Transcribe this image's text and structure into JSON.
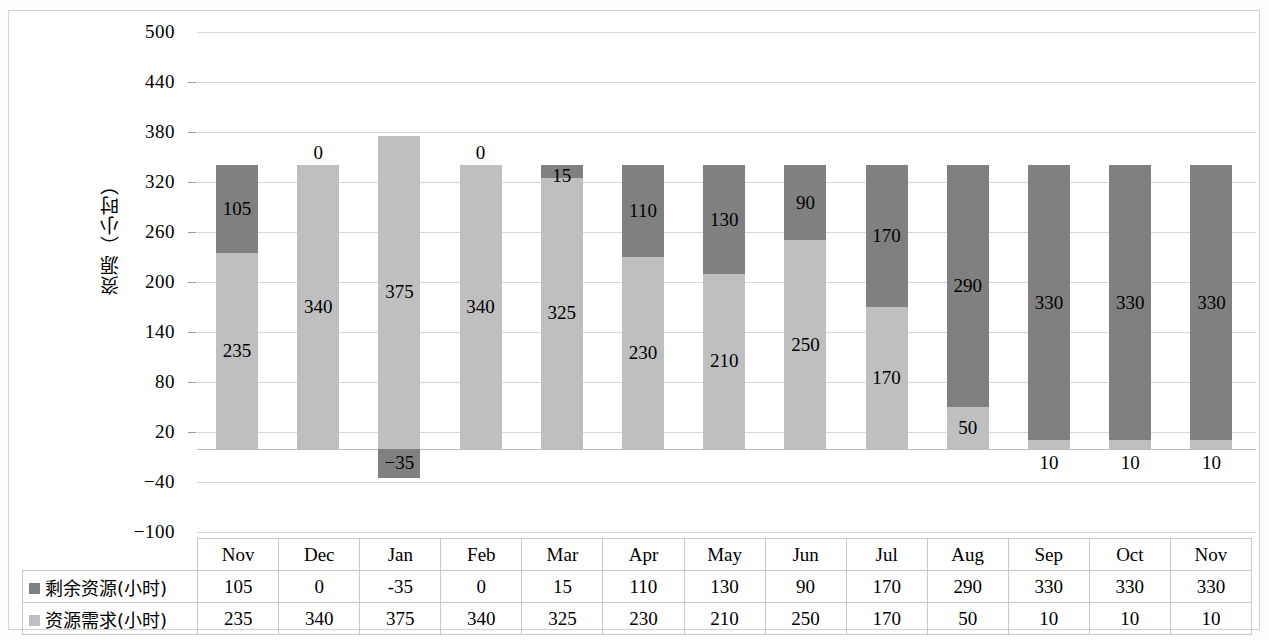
{
  "chart_data": {
    "type": "bar",
    "subtype": "stacked-column",
    "title": "",
    "xlabel": "",
    "ylabel": "资源（小时）",
    "ylim": [
      -100,
      500
    ],
    "yticks": [
      500,
      440,
      380,
      320,
      260,
      200,
      140,
      80,
      20,
      -40,
      -100
    ],
    "ytick_labels": [
      "500",
      "440",
      "380",
      "320",
      "260",
      "200",
      "140",
      "80",
      "20",
      "−40",
      "−100"
    ],
    "grid": true,
    "legend_position": "data-table-row-headers",
    "categories": [
      "Nov",
      "Dec",
      "Jan",
      "Feb",
      "Mar",
      "Apr",
      "May",
      "Jun",
      "Jul",
      "Aug",
      "Sep",
      "Oct",
      "Nov"
    ],
    "series": [
      {
        "name": "资源需求(小时)",
        "color": "#bfbfbf",
        "stack_order": 1,
        "values": [
          235,
          340,
          375,
          340,
          325,
          230,
          210,
          250,
          170,
          50,
          10,
          10,
          10
        ],
        "labels": [
          "235",
          "340",
          "375",
          "340",
          "325",
          "230",
          "210",
          "250",
          "170",
          "50",
          "10",
          "10",
          "10"
        ]
      },
      {
        "name": "剩余资源(小时)",
        "color": "#808080",
        "stack_order": 2,
        "values": [
          105,
          0,
          -35,
          0,
          15,
          110,
          130,
          90,
          170,
          290,
          330,
          330,
          330
        ],
        "labels": [
          "105",
          "0",
          "-35",
          "0",
          "15",
          "110",
          "130",
          "90",
          "170",
          "290",
          "330",
          "330",
          "330"
        ]
      }
    ]
  },
  "table": {
    "header": [
      "Nov",
      "Dec",
      "Jan",
      "Feb",
      "Mar",
      "Apr",
      "May",
      "Jun",
      "Jul",
      "Aug",
      "Sep",
      "Oct",
      "Nov"
    ],
    "rows": [
      {
        "label": "剩余资源(小时)",
        "swatch": "dark-gray-square",
        "values": [
          "105",
          "0",
          "-35",
          "0",
          "15",
          "110",
          "130",
          "90",
          "170",
          "290",
          "330",
          "330",
          "330"
        ]
      },
      {
        "label": "资源需求(小时)",
        "swatch": "light-gray-square",
        "values": [
          "235",
          "340",
          "375",
          "340",
          "325",
          "230",
          "210",
          "250",
          "170",
          "50",
          "10",
          "10",
          "10"
        ]
      }
    ]
  },
  "colors": {
    "remaining": "#808080",
    "demand": "#bfbfbf",
    "grid": "#d6d6d6",
    "frame": "#d0d0d0",
    "text": "#000000"
  }
}
